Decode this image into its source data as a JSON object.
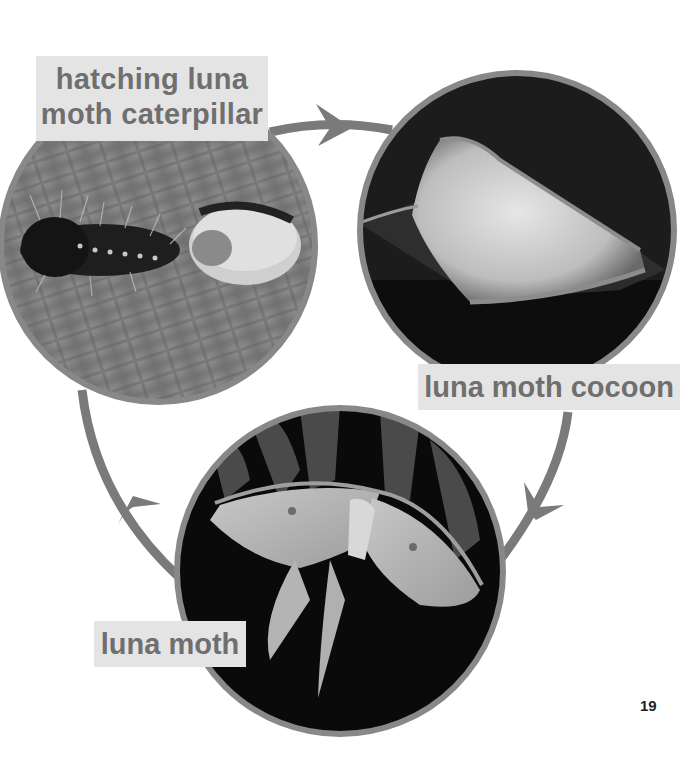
{
  "diagram": {
    "type": "life-cycle",
    "subject": "luna moth",
    "stages": [
      {
        "id": "caterpillar",
        "label": "hatching luna moth caterpillar",
        "label_lines": [
          "hatching luna",
          "moth caterpillar"
        ],
        "photo": "caterpillar hatching beside egg on textured leaf"
      },
      {
        "id": "cocoon",
        "label": "luna moth cocoon",
        "photo": "silken cocoon wrapped in leaf on dark background"
      },
      {
        "id": "moth",
        "label": "luna moth",
        "photo": "adult luna moth with long tails on fern, dark background"
      }
    ],
    "arrows": [
      {
        "from": "caterpillar",
        "to": "cocoon",
        "direction": "clockwise"
      },
      {
        "from": "cocoon",
        "to": "moth",
        "direction": "clockwise"
      },
      {
        "from": "moth",
        "to": "caterpillar",
        "direction": "clockwise"
      }
    ]
  },
  "colors": {
    "arrow": "#7a7a7a",
    "circle_border": "#888888",
    "label_bg": "#e4e4e4",
    "label_text": "#6f6f6f",
    "background": "#ffffff"
  },
  "page_number": "19"
}
